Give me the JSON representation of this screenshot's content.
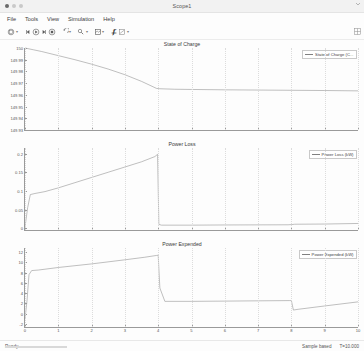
{
  "window": {
    "title": "Scope1",
    "traffic_lights": [
      "close",
      "minimize",
      "zoom"
    ]
  },
  "menubar": {
    "items": [
      {
        "label": "File"
      },
      {
        "label": "Tools"
      },
      {
        "label": "View"
      },
      {
        "label": "Simulation"
      },
      {
        "label": "Help"
      }
    ]
  },
  "toolbar": {
    "groups": [
      {
        "items": [
          {
            "icon": "print-icon",
            "caret": true
          }
        ]
      },
      {
        "items": [
          {
            "icon": "step-back-icon",
            "caret": false
          },
          {
            "icon": "run-icon",
            "caret": false
          },
          {
            "icon": "step-forward-icon",
            "caret": false
          },
          {
            "icon": "stop-icon",
            "caret": false
          }
        ]
      },
      {
        "items": [
          {
            "icon": "simulation-rewind-icon",
            "caret": true
          }
        ]
      },
      {
        "items": [
          {
            "icon": "cursor-measurement-icon",
            "caret": true
          }
        ]
      },
      {
        "items": [
          {
            "icon": "configuration-properties-icon",
            "caret": true
          }
        ]
      },
      {
        "items": [
          {
            "icon": "highlight-signal-icon",
            "caret": false
          },
          {
            "icon": "style-icon",
            "caret": true
          }
        ]
      }
    ],
    "right_icon": "layout-icon",
    "rail_icon": "expand-icon"
  },
  "statusbar": {
    "ready_label": "Ready",
    "sample_mode": "Sample based",
    "time_label": "T=10.000"
  },
  "chart_data": [
    {
      "type": "line",
      "title": "State of Charge",
      "xlabel": "",
      "ylabel": "",
      "xlim": [
        0,
        10
      ],
      "ylim": [
        149.93,
        150.0
      ],
      "xticks": [
        0,
        1,
        2,
        3,
        4,
        5,
        6,
        7,
        8,
        9,
        10
      ],
      "xticklabels": [
        "",
        "",
        "",
        "",
        "",
        "",
        "",
        "",
        "",
        "",
        ""
      ],
      "yticks": [
        149.93,
        149.94,
        149.95,
        149.96,
        149.97,
        149.98,
        149.99,
        150.0
      ],
      "yticklabels": [
        "149.93",
        "149.94",
        "149.95",
        "149.96",
        "149.97",
        "149.98",
        "149.99",
        "150"
      ],
      "grid": false,
      "legend": {
        "position": "top-right",
        "entries": [
          "State of Charge (C..."
        ]
      },
      "series": [
        {
          "name": "State of Charge (C...",
          "color": "#808080",
          "x": [
            0,
            0.25,
            0.5,
            1.0,
            1.5,
            2.0,
            2.5,
            3.0,
            3.5,
            3.95,
            4.05,
            4.5,
            5.0,
            6.0,
            7.0,
            8.0,
            9.0,
            10.0
          ],
          "y": [
            150.0,
            149.9985,
            149.997,
            149.9935,
            149.99,
            149.9862,
            149.982,
            149.9772,
            149.9715,
            149.9655,
            149.9652,
            149.9648,
            149.9646,
            149.9643,
            149.9641,
            149.9639,
            149.9637,
            149.9634
          ]
        }
      ]
    },
    {
      "type": "line",
      "title": "Power Loss",
      "xlabel": "",
      "ylabel": "",
      "xlim": [
        0,
        10
      ],
      "ylim": [
        -0.005,
        0.215
      ],
      "xticks": [
        0,
        1,
        2,
        3,
        4,
        5,
        6,
        7,
        8,
        9,
        10
      ],
      "xticklabels": [
        "",
        "",
        "",
        "",
        "",
        "",
        "",
        "",
        "",
        "",
        ""
      ],
      "yticks": [
        0,
        0.05,
        0.1,
        0.15,
        0.2
      ],
      "yticklabels": [
        "0",
        "0.05",
        "0.1",
        "0.15",
        "0.2"
      ],
      "grid": false,
      "legend": {
        "position": "top-right",
        "entries": [
          "Power Loss (kW)"
        ]
      },
      "series": [
        {
          "name": "Power Loss (kW)",
          "color": "#808080",
          "x": [
            0,
            0.08,
            0.16,
            0.3,
            0.6,
            1.0,
            1.5,
            2.0,
            2.5,
            3.0,
            3.5,
            3.9,
            3.98,
            4.02,
            4.1,
            5.0,
            6.0,
            7.9,
            8.0,
            8.1,
            9.0,
            10.0
          ],
          "y": [
            0.003,
            0.055,
            0.09,
            0.093,
            0.098,
            0.108,
            0.122,
            0.136,
            0.15,
            0.164,
            0.178,
            0.192,
            0.198,
            0.01,
            0.008,
            0.008,
            0.0085,
            0.009,
            0.0095,
            0.0105,
            0.011,
            0.0125
          ]
        }
      ]
    },
    {
      "type": "line",
      "title": "Power Expended",
      "xlabel": "",
      "ylabel": "",
      "xlim": [
        0,
        10
      ],
      "ylim": [
        -2.6,
        12.8
      ],
      "xticks": [
        0,
        1,
        2,
        3,
        4,
        5,
        6,
        7,
        8,
        9,
        10
      ],
      "xticklabels": [
        "0",
        "1",
        "2",
        "3",
        "4",
        "5",
        "6",
        "7",
        "8",
        "9",
        "10"
      ],
      "yticks": [
        -2,
        0,
        2,
        4,
        6,
        8,
        10,
        12
      ],
      "yticklabels": [
        "-2",
        "0",
        "2",
        "4",
        "6",
        "8",
        "10",
        "12"
      ],
      "grid": false,
      "legend": {
        "position": "top-right",
        "entries": [
          "Power Expended (kW)"
        ]
      },
      "series": [
        {
          "name": "Power Expended (kW)",
          "color": "#808080",
          "x": [
            0,
            0.06,
            0.12,
            0.2,
            0.4,
            1.0,
            2.0,
            3.0,
            3.6,
            3.95,
            4.0,
            4.05,
            4.2,
            5.0,
            6.0,
            7.0,
            7.95,
            8.0,
            8.06,
            8.2,
            9.0,
            10.0
          ],
          "y": [
            -1.1,
            2.5,
            7.6,
            8.4,
            8.5,
            9.0,
            9.7,
            10.5,
            11.0,
            11.35,
            11.4,
            5.0,
            2.4,
            2.4,
            2.45,
            2.5,
            2.55,
            2.55,
            0.7,
            0.85,
            1.5,
            2.3
          ]
        }
      ]
    }
  ]
}
